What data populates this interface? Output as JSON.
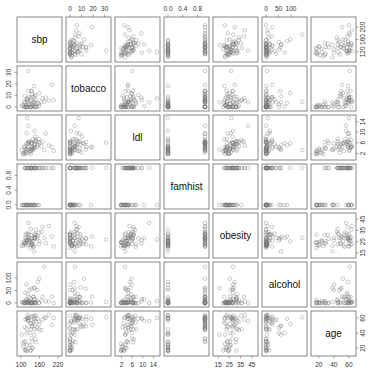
{
  "chart_data": {
    "type": "scatter",
    "title": "",
    "layout": "pairs-matrix",
    "variables": [
      "sbp",
      "tobacco",
      "ldl",
      "famhist",
      "obesity",
      "alcohol",
      "age"
    ],
    "ranges": {
      "sbp": [
        100,
        220
      ],
      "tobacco": [
        0,
        32
      ],
      "ldl": [
        1,
        15
      ],
      "famhist": [
        0,
        1
      ],
      "obesity": [
        14,
        47
      ],
      "alcohol": [
        0,
        148
      ],
      "age": [
        15,
        64
      ]
    },
    "ticks": {
      "top": {
        "tobacco": [
          "0",
          "10",
          "20",
          "30"
        ],
        "famhist": [
          "0.0",
          "0.4",
          "0.8"
        ],
        "alcohol": [
          "0",
          "50",
          "100"
        ]
      },
      "bottom": {
        "sbp": [
          "100",
          "160",
          "220"
        ],
        "ldl": [
          "2",
          "6",
          "10",
          "14"
        ],
        "obesity": [
          "15",
          "25",
          "35",
          "45"
        ],
        "age": [
          "20",
          "40",
          "60"
        ]
      },
      "left": {
        "tobacco": [
          "0",
          "10",
          "20",
          "30"
        ],
        "famhist": [
          "0.0",
          "0.4",
          "0.8"
        ],
        "alcohol": [
          "0",
          "50",
          "100"
        ]
      },
      "right": {
        "sbp": [
          "120",
          "160",
          "200"
        ],
        "ldl": [
          "2",
          "6",
          "10",
          "14"
        ],
        "obesity": [
          "15",
          "25",
          "35",
          "45"
        ],
        "age": [
          "20",
          "40",
          "60"
        ]
      }
    },
    "observations": [
      [
        160,
        12.0,
        5.73,
        1,
        25.3,
        97.2,
        52
      ],
      [
        144,
        0.01,
        4.41,
        0,
        28.61,
        2.06,
        63
      ],
      [
        118,
        0.08,
        3.48,
        1,
        32.28,
        3.81,
        46
      ],
      [
        170,
        7.5,
        6.41,
        1,
        38.03,
        24.26,
        58
      ],
      [
        134,
        13.6,
        3.5,
        1,
        27.78,
        57.34,
        49
      ],
      [
        132,
        6.2,
        6.47,
        1,
        36.21,
        0.0,
        45
      ],
      [
        142,
        4.05,
        3.38,
        0,
        16.2,
        59.76,
        38
      ],
      [
        114,
        4.08,
        4.59,
        1,
        28.3,
        40.8,
        58
      ],
      [
        114,
        0.0,
        3.83,
        1,
        23.51,
        0.0,
        29
      ],
      [
        132,
        0.0,
        5.8,
        1,
        30.96,
        18.72,
        53
      ],
      [
        206,
        6.0,
        2.95,
        1,
        20.81,
        0.0,
        60
      ],
      [
        134,
        14.1,
        4.44,
        1,
        22.39,
        1.37,
        62
      ],
      [
        118,
        0.0,
        1.88,
        0,
        24.11,
        0.0,
        16
      ],
      [
        132,
        0.0,
        1.87,
        0,
        24.23,
        2.57,
        17
      ],
      [
        112,
        9.65,
        2.29,
        1,
        23.53,
        0.69,
        48
      ],
      [
        117,
        1.53,
        2.44,
        0,
        21.75,
        5.28,
        18
      ],
      [
        120,
        7.5,
        15.33,
        0,
        26.86,
        6.86,
        60
      ],
      [
        146,
        10.5,
        8.29,
        1,
        27.75,
        0.0,
        59
      ],
      [
        158,
        2.6,
        7.46,
        0,
        22.64,
        0.0,
        45
      ],
      [
        124,
        14.0,
        6.23,
        1,
        28.09,
        0.0,
        58
      ],
      [
        106,
        1.61,
        1.74,
        0,
        21.03,
        2.06,
        26
      ],
      [
        132,
        7.9,
        2.85,
        1,
        21.68,
        0.0,
        53
      ],
      [
        150,
        0.3,
        6.38,
        1,
        30.85,
        7.2,
        28
      ],
      [
        138,
        0.6,
        3.81,
        0,
        22.48,
        0.0,
        20
      ],
      [
        142,
        18.2,
        4.34,
        0,
        20.79,
        2.16,
        59
      ],
      [
        124,
        4.0,
        12.42,
        1,
        41.76,
        0.0,
        56
      ],
      [
        118,
        6.0,
        9.65,
        1,
        26.21,
        15.26,
        59
      ],
      [
        145,
        9.1,
        5.24,
        1,
        29.17,
        61.27,
        50
      ],
      [
        144,
        4.09,
        5.55,
        1,
        31.75,
        14.2,
        45
      ],
      [
        146,
        0.0,
        6.62,
        1,
        31.03,
        0.0,
        32
      ],
      [
        136,
        2.52,
        3.95,
        0,
        25.42,
        0.0,
        29
      ],
      [
        158,
        1.02,
        6.33,
        1,
        33.36,
        0.0,
        55
      ],
      [
        122,
        6.6,
        5.58,
        1,
        32.16,
        35.12,
        57
      ],
      [
        126,
        8.75,
        6.53,
        0,
        31.54,
        22.68,
        60
      ],
      [
        148,
        5.5,
        7.1,
        0,
        35.58,
        0.0,
        63
      ],
      [
        122,
        4.26,
        4.44,
        0,
        22.73,
        4.32,
        64
      ],
      [
        140,
        3.9,
        7.32,
        1,
        20.49,
        24.39,
        54
      ],
      [
        110,
        4.64,
        4.55,
        0,
        23.18,
        2.5,
        28
      ],
      [
        130,
        0.0,
        2.82,
        0,
        19.38,
        0.0,
        17
      ],
      [
        136,
        11.2,
        5.81,
        1,
        23.02,
        1.43,
        49
      ],
      [
        118,
        0.28,
        5.8,
        0,
        28.34,
        73.84,
        40
      ],
      [
        144,
        0.76,
        10.53,
        0,
        28.07,
        15.12,
        56
      ],
      [
        115,
        0.0,
        3.08,
        0,
        31.32,
        12.6,
        17
      ],
      [
        134,
        0.0,
        5.9,
        1,
        27.54,
        0.43,
        33
      ],
      [
        128,
        0.0,
        2.43,
        0,
        26.53,
        8.23,
        24
      ],
      [
        136,
        1.81,
        3.31,
        0,
        21.73,
        2.06,
        21
      ],
      [
        112,
        0.0,
        1.71,
        0,
        24.71,
        0.0,
        18
      ],
      [
        140,
        8.6,
        3.9,
        1,
        25.63,
        25.22,
        62
      ],
      [
        180,
        8.2,
        9.42,
        1,
        23.51,
        7.0,
        60
      ],
      [
        120,
        0.0,
        3.4,
        0,
        25.45,
        0.0,
        24
      ],
      [
        108,
        0.5,
        2.08,
        0,
        24.96,
        0.0,
        22
      ],
      [
        176,
        4.5,
        3.25,
        1,
        28.48,
        145.29,
        61
      ],
      [
        200,
        19.2,
        4.43,
        1,
        29.74,
        25.71,
        51
      ],
      [
        152,
        0.0,
        4.42,
        1,
        28.09,
        51.4,
        47
      ],
      [
        154,
        3.4,
        5.05,
        0,
        29.77,
        83.97,
        59
      ],
      [
        128,
        2.4,
        3.76,
        0,
        26.15,
        52.33,
        40
      ],
      [
        166,
        4.6,
        4.71,
        1,
        33.65,
        9.97,
        44
      ],
      [
        124,
        31.2,
        6.06,
        1,
        26.74,
        4.55,
        61
      ],
      [
        190,
        5.42,
        4.94,
        1,
        38.98,
        5.4,
        64
      ],
      [
        102,
        1.0,
        3.3,
        0,
        21.41,
        3.6,
        38
      ]
    ]
  }
}
